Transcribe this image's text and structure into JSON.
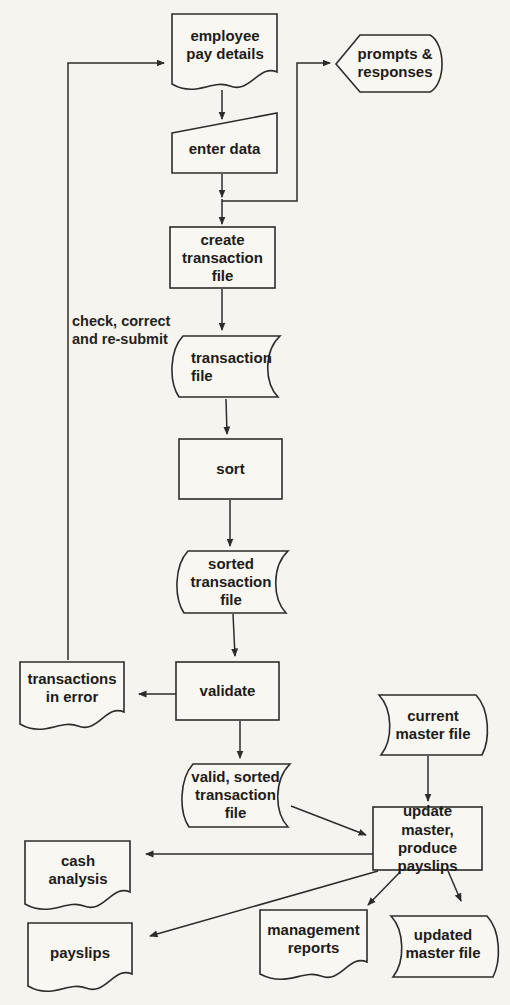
{
  "diagram": {
    "colors": {
      "background": "#f6f4ef",
      "line": "#2e2c29",
      "text": "#1d1c1a",
      "node_fill": "#f9f7f2"
    },
    "nodes": {
      "employee_pay_details": {
        "label": "employee pay details",
        "shape": "document"
      },
      "prompts_responses": {
        "label": "prompts & responses",
        "shape": "display"
      },
      "enter_data": {
        "label": "enter data",
        "shape": "manual-input"
      },
      "create_transaction_file": {
        "label": "create transaction file",
        "shape": "process"
      },
      "transaction_file": {
        "label": "transaction file",
        "shape": "file"
      },
      "sort": {
        "label": "sort",
        "shape": "process"
      },
      "sorted_transaction_file": {
        "label": "sorted transaction file",
        "shape": "file"
      },
      "validate": {
        "label": "validate",
        "shape": "process"
      },
      "transactions_in_error": {
        "label": "transactions in error",
        "shape": "document"
      },
      "valid_sorted_transaction_file": {
        "label": "valid, sorted transaction file",
        "shape": "file"
      },
      "current_master_file": {
        "label": "current master file",
        "shape": "file"
      },
      "update_master_produce_payslips": {
        "label": "update master, produce payslips",
        "shape": "process"
      },
      "cash_analysis": {
        "label": "cash analysis",
        "shape": "document"
      },
      "payslips": {
        "label": "payslips",
        "shape": "document"
      },
      "management_reports": {
        "label": "management reports",
        "shape": "document"
      },
      "updated_master_file": {
        "label": "updated master file",
        "shape": "file"
      }
    },
    "annotation": {
      "feedback_label": "check, correct and re-submit"
    },
    "edges": [
      {
        "from": "employee_pay_details",
        "to": "enter_data"
      },
      {
        "from": "enter_data",
        "to": "create_transaction_file"
      },
      {
        "from": "enter_data",
        "to": "prompts_responses"
      },
      {
        "from": "create_transaction_file",
        "to": "transaction_file"
      },
      {
        "from": "transaction_file",
        "to": "sort"
      },
      {
        "from": "sort",
        "to": "sorted_transaction_file"
      },
      {
        "from": "sorted_transaction_file",
        "to": "validate"
      },
      {
        "from": "validate",
        "to": "transactions_in_error"
      },
      {
        "from": "validate",
        "to": "valid_sorted_transaction_file"
      },
      {
        "from": "transactions_in_error",
        "to": "employee_pay_details",
        "label": "check, correct and re-submit"
      },
      {
        "from": "valid_sorted_transaction_file",
        "to": "update_master_produce_payslips"
      },
      {
        "from": "current_master_file",
        "to": "update_master_produce_payslips"
      },
      {
        "from": "update_master_produce_payslips",
        "to": "cash_analysis"
      },
      {
        "from": "update_master_produce_payslips",
        "to": "payslips"
      },
      {
        "from": "update_master_produce_payslips",
        "to": "management_reports"
      },
      {
        "from": "update_master_produce_payslips",
        "to": "updated_master_file"
      }
    ]
  }
}
